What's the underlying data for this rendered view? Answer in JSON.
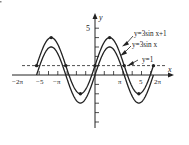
{
  "chart_data": {
    "type": "line",
    "title": "",
    "xlabel": "x",
    "ylabel": "y",
    "xlim": [
      -6.6,
      7.1
    ],
    "ylim": [
      -5,
      5.8
    ],
    "grid": false,
    "x_tick_labels": [
      "-2π",
      "-5",
      "-π",
      "π",
      "5",
      "2π"
    ],
    "x_tick_values": [
      -6.2832,
      -5,
      -3.1416,
      3.1416,
      5,
      6.2832
    ],
    "y_tick_labels": [
      "5"
    ],
    "y_tick_values": [
      5
    ],
    "series": [
      {
        "name": "y=3sin x+1",
        "formula": "3*sin(x)+1",
        "domain": [
          -6.2832,
          6.2832
        ],
        "style": "solid",
        "key_points": [
          [
            -6.2832,
            1
          ],
          [
            -4.7124,
            4
          ],
          [
            -3.1416,
            1
          ],
          [
            -1.5708,
            -2
          ],
          [
            0,
            1
          ],
          [
            1.5708,
            4
          ],
          [
            3.1416,
            1
          ],
          [
            4.7124,
            -2
          ],
          [
            6.2832,
            1
          ]
        ]
      },
      {
        "name": "y=3sin x",
        "formula": "3*sin(x)",
        "domain": [
          -6.2832,
          6.2832
        ],
        "style": "solid",
        "key_points": [
          [
            -6.2832,
            0
          ],
          [
            -4.7124,
            3
          ],
          [
            -3.1416,
            0
          ],
          [
            -1.5708,
            -3
          ],
          [
            0,
            0
          ],
          [
            1.5708,
            3
          ],
          [
            3.1416,
            0
          ],
          [
            4.7124,
            -3
          ],
          [
            6.2832,
            0
          ]
        ]
      },
      {
        "name": "y=1",
        "formula": "1",
        "domain": [
          -6.6,
          7.1
        ],
        "style": "dashed",
        "key_points": [
          [
            -6.6,
            1
          ],
          [
            7.1,
            1
          ]
        ]
      }
    ],
    "annotations": [
      "y=3sin x+1",
      "y=3sin x",
      "y=1"
    ],
    "legend_position": "right (inline arrow annotations)"
  },
  "labels": {
    "x_axis": "x",
    "y_axis": "y",
    "y5": "5",
    "xm2pi": "−2π",
    "xm5": "−5",
    "xmpi": "−π",
    "xpi": "π",
    "x5": "5",
    "x2pi": "2π",
    "ann1": "y=3sin x+1",
    "ann2": "y=3sin x",
    "ann3": "y=1"
  }
}
